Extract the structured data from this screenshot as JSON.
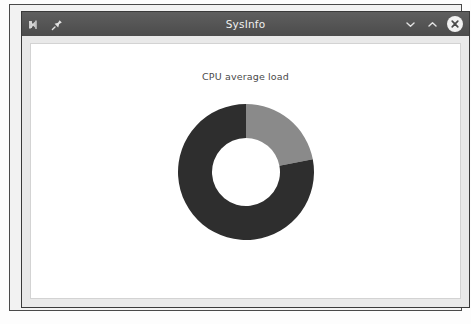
{
  "window": {
    "title": "SysInfo",
    "titlebar_icons": [
      {
        "name": "app-logo-icon",
        "glyph": "checkmark-badge"
      },
      {
        "name": "pin-icon",
        "glyph": "pushpin"
      }
    ],
    "controls": [
      {
        "name": "minimize-button",
        "label": "Minimize",
        "glyph": "chevron-down"
      },
      {
        "name": "maximize-button",
        "label": "Maximize",
        "glyph": "chevron-up"
      },
      {
        "name": "close-button",
        "label": "Close",
        "glyph": "x-circle"
      }
    ],
    "colors": {
      "titlebar": "#545454",
      "titlebar_text": "#f0f0f0",
      "window_chrome": "#e9e9e9",
      "content_background": "#ffffff",
      "frame_border": "#3a3a3a"
    }
  },
  "chart_data": {
    "type": "pie",
    "variant": "donut",
    "title": "CPU average load",
    "xlabel": "",
    "ylabel": "",
    "legend_position": "none",
    "grid": false,
    "start_angle_deg": 0,
    "direction": "clockwise",
    "hole_ratio": 0.5,
    "categories": [
      "Used",
      "Idle"
    ],
    "values": [
      22,
      78
    ],
    "units": "percent",
    "colors": [
      "#8a8a8a",
      "#2e2e2e"
    ],
    "series": [
      {
        "name": "CPU average load",
        "values": [
          22,
          78
        ]
      }
    ],
    "geometry": {
      "center_x": 70,
      "center_y": 70,
      "outer_radius": 68,
      "inner_radius": 34
    }
  }
}
